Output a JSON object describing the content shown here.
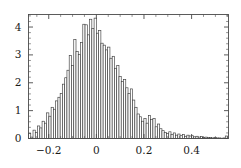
{
  "chart_data": {
    "type": "bar",
    "subtype": "histogram",
    "title": "",
    "subtitle": "",
    "xlabel": "",
    "ylabel": "",
    "xlim": [
      -0.285,
      0.555
    ],
    "ylim": [
      0,
      4.45
    ],
    "grid": false,
    "legend": null,
    "bar_color": "#ffffff",
    "bar_edge_color": "#3c3c3c",
    "axis_color": "#4a4a4a",
    "frame": true,
    "frame_ticks_all_sides": true,
    "bin_width": 0.0095,
    "x_ticks_major": [
      -0.2,
      0,
      0.2,
      0.4
    ],
    "x_tick_labels": [
      "-0.2",
      "0",
      "0.2",
      "0.4"
    ],
    "y_ticks_major": [
      0,
      1,
      2,
      3,
      4
    ],
    "y_tick_labels": [
      "0",
      "1",
      "2",
      "3",
      "4"
    ],
    "x_minor_tick_step": 0.05,
    "y_minor_tick_step": 0.2,
    "bin_left_edges": [
      -0.285,
      -0.2755,
      -0.266,
      -0.2565,
      -0.247,
      -0.2375,
      -0.228,
      -0.2185,
      -0.209,
      -0.1995,
      -0.19,
      -0.1805,
      -0.171,
      -0.1615,
      -0.152,
      -0.1425,
      -0.133,
      -0.1235,
      -0.114,
      -0.1045,
      -0.095,
      -0.0855,
      -0.076,
      -0.0665,
      -0.057,
      -0.0475,
      -0.038,
      -0.0285,
      -0.019,
      -0.0095,
      0.0,
      0.0095,
      0.019,
      0.0285,
      0.038,
      0.0475,
      0.057,
      0.0665,
      0.076,
      0.0855,
      0.095,
      0.1045,
      0.114,
      0.1235,
      0.133,
      0.1425,
      0.152,
      0.1615,
      0.171,
      0.1805,
      0.19,
      0.1995,
      0.209,
      0.2185,
      0.228,
      0.2375,
      0.247,
      0.2565,
      0.266,
      0.2755,
      0.285,
      0.2945,
      0.304,
      0.3135,
      0.323,
      0.3325,
      0.342,
      0.3515,
      0.361,
      0.3705,
      0.38,
      0.3895,
      0.399,
      0.4085,
      0.418,
      0.4275,
      0.437,
      0.4465,
      0.456,
      0.4655,
      0.475,
      0.4845,
      0.494,
      0.5035,
      0.513,
      0.5225,
      0.532,
      0.5415
    ],
    "values": [
      0.18,
      0.05,
      0.3,
      0.22,
      0.45,
      0.38,
      0.62,
      0.55,
      0.92,
      0.8,
      1.12,
      1.05,
      1.35,
      1.48,
      1.62,
      1.95,
      2.18,
      2.45,
      2.98,
      2.62,
      3.55,
      3.12,
      3.02,
      3.45,
      4.1,
      4.08,
      3.72,
      4.28,
      3.95,
      4.32,
      3.78,
      3.88,
      3.42,
      3.35,
      3.18,
      3.28,
      2.88,
      2.95,
      2.52,
      2.62,
      2.22,
      2.05,
      2.12,
      1.82,
      1.62,
      1.78,
      1.38,
      1.12,
      0.88,
      0.78,
      0.62,
      0.72,
      0.55,
      0.82,
      0.68,
      0.72,
      0.42,
      0.52,
      0.35,
      0.28,
      0.22,
      0.18,
      0.24,
      0.15,
      0.2,
      0.12,
      0.16,
      0.1,
      0.14,
      0.08,
      0.12,
      0.09,
      0.1,
      0.06,
      0.08,
      0.05,
      0.07,
      0.04,
      0.05,
      0.03,
      0.04,
      0.02,
      0.03,
      0.02,
      0.02,
      0.01,
      0.02,
      0.09
    ]
  }
}
